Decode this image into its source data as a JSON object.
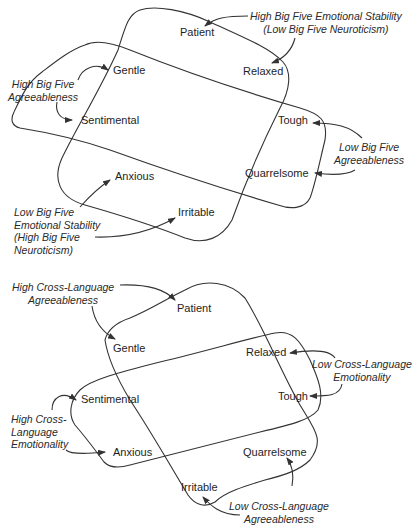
{
  "top_diagram": {
    "traits": {
      "patient": "Patient",
      "relaxed": "Relaxed",
      "gentle": "Gentle",
      "sentimental": "Sentimental",
      "tough": "Tough",
      "quarrelsome": "Quarrelsome",
      "anxious": "Anxious",
      "irritable": "Irritable"
    },
    "annotations": {
      "high_emotional_stability": [
        "High Big Five Emotional Stability",
        "(Low Big Five Neuroticism)"
      ],
      "high_agreeableness": [
        "High Big Five",
        "Agreeableness"
      ],
      "low_agreeableness": [
        "Low Big Five",
        "Agreeableness"
      ],
      "low_emotional_stability": [
        "Low Big Five",
        "Emotional Stability",
        "(High Big Five",
        "Neuroticism)"
      ]
    }
  },
  "bottom_diagram": {
    "traits": {
      "patient": "Patient",
      "gentle": "Gentle",
      "relaxed": "Relaxed",
      "tough": "Tough",
      "sentimental": "Sentimental",
      "anxious": "Anxious",
      "quarrelsome": "Quarrelsome",
      "irritable": "Irritable"
    },
    "annotations": {
      "high_agreeableness": [
        "High Cross-Language",
        "Agreeableness"
      ],
      "low_emotionality": [
        "Low Cross-Language",
        "Emotionality"
      ],
      "high_emotionality": [
        "High Cross-",
        "Language",
        "Emotionality"
      ],
      "low_agreeableness": [
        "Low Cross-Language",
        "Agreeableness"
      ]
    }
  },
  "colors": {
    "stroke": "#333333",
    "text": "#1e1e1e"
  }
}
